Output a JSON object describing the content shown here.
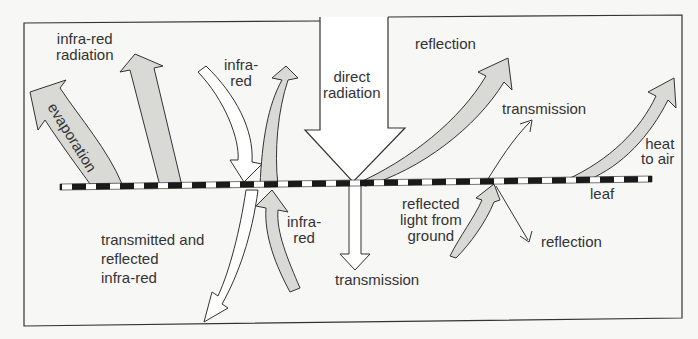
{
  "diagram": {
    "colors": {
      "background": "#f7f7f5",
      "line": "#333333",
      "arrow_fill_grey": "#d9d9d6",
      "arrow_fill_white": "#ffffff",
      "leaf_dash_dark": "#1a1a1a",
      "leaf_dash_light": "#ffffff"
    },
    "labels": {
      "infrared_radiation_1": "infra-red",
      "infrared_radiation_2": "radiation",
      "evaporation": "evaporation",
      "infrared_in_1": "infra-",
      "infrared_in_2": "red",
      "direct_radiation_1": "direct",
      "direct_radiation_2": "radiation",
      "reflection_top": "reflection",
      "transmission_top": "transmission",
      "heat_to_air_1": "heat",
      "heat_to_air_2": "to air",
      "leaf": "leaf",
      "transmitted_reflected_1": "transmitted and",
      "transmitted_reflected_2": "reflected",
      "transmitted_reflected_3": "infra-red",
      "infrared_below_1": "infra-",
      "infrared_below_2": "red",
      "transmission_bottom": "transmission",
      "reflected_ground_1": "reflected",
      "reflected_ground_2": "light from",
      "reflected_ground_3": "ground",
      "reflection_bottom": "reflection"
    }
  }
}
